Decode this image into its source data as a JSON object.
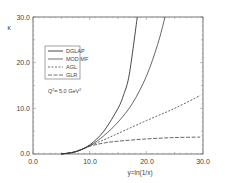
{
  "chart_data": {
    "type": "line",
    "title": "",
    "xlabel": "y=ln(1/x)",
    "ylabel": "κ",
    "xlim": [
      0,
      30
    ],
    "ylim": [
      0,
      30
    ],
    "xticks": [
      "0.0",
      "10.0",
      "20.0",
      "30.0"
    ],
    "yticks": [
      "0.0",
      "10.0",
      "20.0",
      "30.0"
    ],
    "grid": false,
    "legend_position": "upper-left",
    "annotation": "Q² = 5.0 GeV²",
    "annotation_base": "Q",
    "annotation_sup1": "2",
    "annotation_mid": "= 5.0 GeV",
    "annotation_sup2": "2",
    "series": [
      {
        "name": "DGLAP",
        "style": "solid",
        "x": [
          5,
          7.5,
          10,
          12.5,
          15,
          16,
          17,
          18.4
        ],
        "values": [
          0,
          0.5,
          2,
          5,
          10,
          13,
          17.5,
          30
        ]
      },
      {
        "name": "MOD MF",
        "style": "solid",
        "x": [
          5,
          7.5,
          10,
          12.5,
          15,
          17.5,
          20,
          22,
          23.3
        ],
        "values": [
          0,
          0.5,
          1.8,
          4,
          7,
          11,
          17,
          24,
          30
        ]
      },
      {
        "name": "AGL",
        "style": "short-dash",
        "x": [
          5,
          7.5,
          10,
          12.5,
          15,
          20,
          25,
          29.5
        ],
        "values": [
          0,
          0.5,
          1.8,
          3.1,
          4.5,
          7.3,
          10,
          12.8
        ]
      },
      {
        "name": "GLR",
        "style": "long-dash",
        "x": [
          5,
          7.5,
          10,
          12.5,
          15,
          20,
          25,
          29.5
        ],
        "values": [
          0,
          0.5,
          1.7,
          2.4,
          2.8,
          3.3,
          3.6,
          3.7
        ]
      }
    ]
  }
}
